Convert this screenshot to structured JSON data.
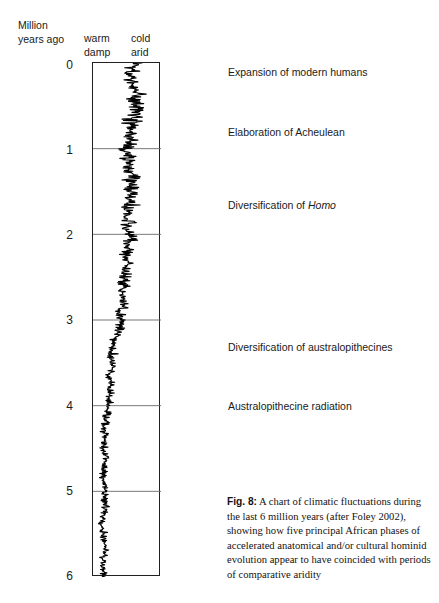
{
  "figure": {
    "bleed_text": "▪▪▪ ▪▪ ▪▪ ▪▪▪ ▪▪   ▪▪ ▪▪▪ ▪▪ ▪▪ ▪▪  ▪▪▪ ▪▪ ▪▪▪",
    "axis_title_line1": "Million",
    "axis_title_line2": "years ago",
    "left_header_line1": "warm",
    "left_header_line2": "damp",
    "right_header_line1": "cold",
    "right_header_line2": "arid",
    "caption_label": "Fig. 8:",
    "caption_text": " A chart of climatic fluctuations during the last 6 million years (after Foley 2002), showing how five principal African phases of accelerated anatomical and/or cultural hominid evolution appear to have coincided with periods of comparative aridity",
    "colors": {
      "ink": "#241f20",
      "gridline": "#6a6a6a",
      "curve": "#000000",
      "background": "#ffffff"
    }
  },
  "chart_data": {
    "type": "line",
    "title": "A chart of climatic fluctuations during the last 6 million years",
    "orientation": "vertical",
    "xlabel": "climate (warm/damp ← → cold/arid)",
    "ylabel": "Million years ago",
    "ylim": [
      0,
      6
    ],
    "yticks": [
      0,
      1,
      2,
      3,
      4,
      5,
      6
    ],
    "ytick_labels": [
      "0",
      "1",
      "2",
      "3",
      "4",
      "5",
      "6"
    ],
    "y_axis_inverted": true,
    "grid": true,
    "gridlines_at": [
      1,
      2,
      3,
      4,
      5
    ],
    "legend": "none",
    "x_category_labels": [
      "warm damp",
      "cold arid"
    ],
    "series_name": "climate oscillation proxy",
    "series_note": "High-frequency oscillating climate proxy trace; amplitude and mean shift toward cold/arid (right) in the last ~2.5 Myr and toward warm/damp (left) before ~3.5 Myr.",
    "trend_mean_x_fraction": [
      {
        "y": 0.0,
        "x": 0.6
      },
      {
        "y": 0.5,
        "x": 0.6
      },
      {
        "y": 1.0,
        "x": 0.57
      },
      {
        "y": 1.5,
        "x": 0.55
      },
      {
        "y": 2.0,
        "x": 0.52
      },
      {
        "y": 2.5,
        "x": 0.47
      },
      {
        "y": 3.0,
        "x": 0.4
      },
      {
        "y": 3.5,
        "x": 0.28
      },
      {
        "y": 4.0,
        "x": 0.2
      },
      {
        "y": 4.5,
        "x": 0.18
      },
      {
        "y": 5.0,
        "x": 0.17
      },
      {
        "y": 5.5,
        "x": 0.17
      },
      {
        "y": 6.0,
        "x": 0.17
      }
    ],
    "amplitude_x_fraction": [
      {
        "y": 0.0,
        "amp": 0.22
      },
      {
        "y": 1.0,
        "amp": 0.24
      },
      {
        "y": 2.0,
        "amp": 0.2
      },
      {
        "y": 3.0,
        "amp": 0.14
      },
      {
        "y": 4.0,
        "amp": 0.1
      },
      {
        "y": 5.0,
        "amp": 0.09
      },
      {
        "y": 6.0,
        "amp": 0.09
      }
    ],
    "annotations": [
      {
        "label": "Expansion of modern humans",
        "y_mya": 0.13
      },
      {
        "label": "Elaboration of Acheulean",
        "y_mya": 0.68
      },
      {
        "label": "Diversification of Homo",
        "y_mya": 1.71,
        "italic_word": "Homo"
      },
      {
        "label": "Diversification of australopithecines",
        "y_mya": 3.27
      },
      {
        "label": "Australopithecine radiation",
        "y_mya": 3.95
      }
    ]
  },
  "ytick_list": [
    {
      "label": "0",
      "top": 59
    },
    {
      "label": "1",
      "top": 144
    },
    {
      "label": "2",
      "top": 229
    },
    {
      "label": "3",
      "top": 314
    },
    {
      "label": "4",
      "top": 400
    },
    {
      "label": "5",
      "top": 485
    },
    {
      "label": "6",
      "top": 570
    }
  ],
  "events": [
    {
      "label": "Expansion of modern humans",
      "top": 66,
      "italic": ""
    },
    {
      "label": "Elaboration of Acheulean",
      "top": 126,
      "italic": ""
    },
    {
      "label": "Diversification of ",
      "top": 199,
      "italic": "Homo"
    },
    {
      "label": "Diversification of australopithecines",
      "top": 341,
      "italic": ""
    },
    {
      "label": "Australopithecine radiation",
      "top": 400,
      "italic": ""
    }
  ]
}
